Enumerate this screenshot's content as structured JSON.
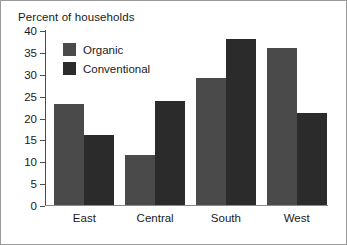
{
  "chart_data": {
    "type": "bar",
    "title": "Percent of households",
    "xlabel": "",
    "ylabel": "",
    "categories": [
      "East",
      "Central",
      "South",
      "West"
    ],
    "series": [
      {
        "name": "Organic",
        "color": "#4a4a4a",
        "values": [
          23,
          11.5,
          29,
          36
        ]
      },
      {
        "name": "Conventional",
        "color": "#2b2b2b",
        "values": [
          16,
          23.7,
          38,
          21
        ]
      }
    ],
    "ylim": [
      0,
      40
    ],
    "ytick_step": 5,
    "yticks": [
      0,
      5,
      10,
      15,
      20,
      25,
      30,
      35,
      40
    ],
    "ytick_labels": [
      "0",
      "5",
      "10",
      "15",
      "20",
      "25",
      "30",
      "35",
      "40"
    ],
    "grid": false,
    "legend_position": "upper-left-inside",
    "legend": [
      "Organic",
      "Conventional"
    ]
  }
}
